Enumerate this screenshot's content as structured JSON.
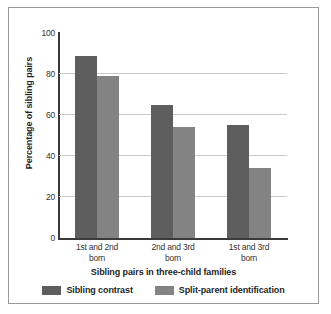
{
  "chart_data": {
    "type": "bar",
    "title": "",
    "xlabel": "Sibling pairs in three-child families",
    "ylabel": "Percentage of sibling pairs",
    "categories": [
      "1st and 2nd born",
      "2nd and 3rd born",
      "1st and 3rd born"
    ],
    "category_lines": [
      [
        "1st and 2nd",
        "born"
      ],
      [
        "2nd and 3rd",
        "born"
      ],
      [
        "1st and 3rd",
        "born"
      ]
    ],
    "series": [
      {
        "name": "Sibling contrast",
        "color": "#5e5e5e",
        "values": [
          89,
          65,
          55
        ]
      },
      {
        "name": "Split-parent identification",
        "color": "#838383",
        "values": [
          79,
          54,
          34
        ]
      }
    ],
    "ylim": [
      0,
      100
    ],
    "yticks": [
      0,
      20,
      40,
      60,
      80,
      100
    ],
    "ytick_labels": [
      "0",
      "20",
      "40",
      "60",
      "80",
      "100"
    ],
    "grid": true,
    "grid_color": "#c9c9c9",
    "legend_position": "bottom",
    "axis_color": "#3a3a3a",
    "frame_color": "#9a9a9a",
    "background": "#ffffff"
  }
}
